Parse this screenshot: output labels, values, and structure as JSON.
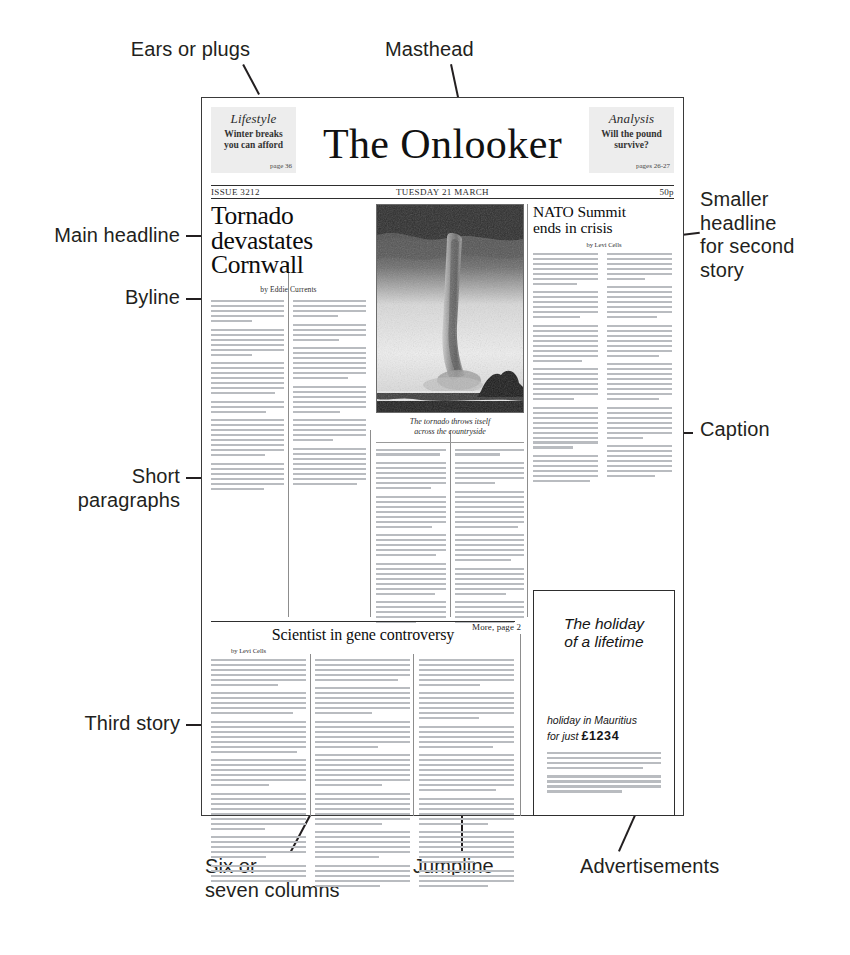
{
  "diagram": {
    "annotations": [
      {
        "name": "ears-or-plugs",
        "text": "Ears or plugs"
      },
      {
        "name": "masthead",
        "text": "Masthead"
      },
      {
        "name": "main-headline",
        "text": "Main headline"
      },
      {
        "name": "byline",
        "text": "Byline"
      },
      {
        "name": "short-paragraphs",
        "text": "Short\nparagraphs"
      },
      {
        "name": "third-story",
        "text": "Third story"
      },
      {
        "name": "smaller-headline",
        "text": "Smaller\nheadline\nfor second\nstory"
      },
      {
        "name": "caption",
        "text": "Caption"
      },
      {
        "name": "six-or-seven-columns",
        "text": "Six or\nseven columns"
      },
      {
        "name": "jumpline",
        "text": "Jumpline"
      },
      {
        "name": "advertisements",
        "text": "Advertisements"
      }
    ]
  },
  "newspaper": {
    "title": "The Onlooker",
    "ear_left": {
      "title": "Lifestyle",
      "line1": "Winter breaks",
      "line2": "you can afford",
      "page": "page 36"
    },
    "ear_right": {
      "title": "Analysis",
      "line1": "Will the pound",
      "line2": "survive?",
      "page": "pages 26-27"
    },
    "dateline": {
      "issue": "ISSUE 3212",
      "date": "TUESDAY 21 MARCH",
      "price": "50p"
    },
    "lead_story": {
      "headline_line1": "Tornado",
      "headline_line2": "devastates",
      "headline_line3": "Cornwall",
      "byline": "by Eddie Currents"
    },
    "photo": {
      "caption_line1": "The tornado throws itself",
      "caption_line2": "across the countryside",
      "alt": "tornado-photograph"
    },
    "second_story": {
      "headline_line1": "NATO Summit",
      "headline_line2": "ends in crisis",
      "byline": "by Levi Cells"
    },
    "jumpline": "More, page 2",
    "third_story": {
      "headline": "Scientist in gene controversy",
      "byline": "by Levi Cells"
    },
    "advert": {
      "headline_line1": "The holiday",
      "headline_line2": "of a lifetime",
      "body_line1": "holiday in Mauritius",
      "body_line2_pre": "for just ",
      "price": "£1234"
    }
  },
  "colors": {
    "ink": "#231f20",
    "rule": "#2e2e2e",
    "greek": "#b9bcc0",
    "ear_bg": "#ededed"
  }
}
